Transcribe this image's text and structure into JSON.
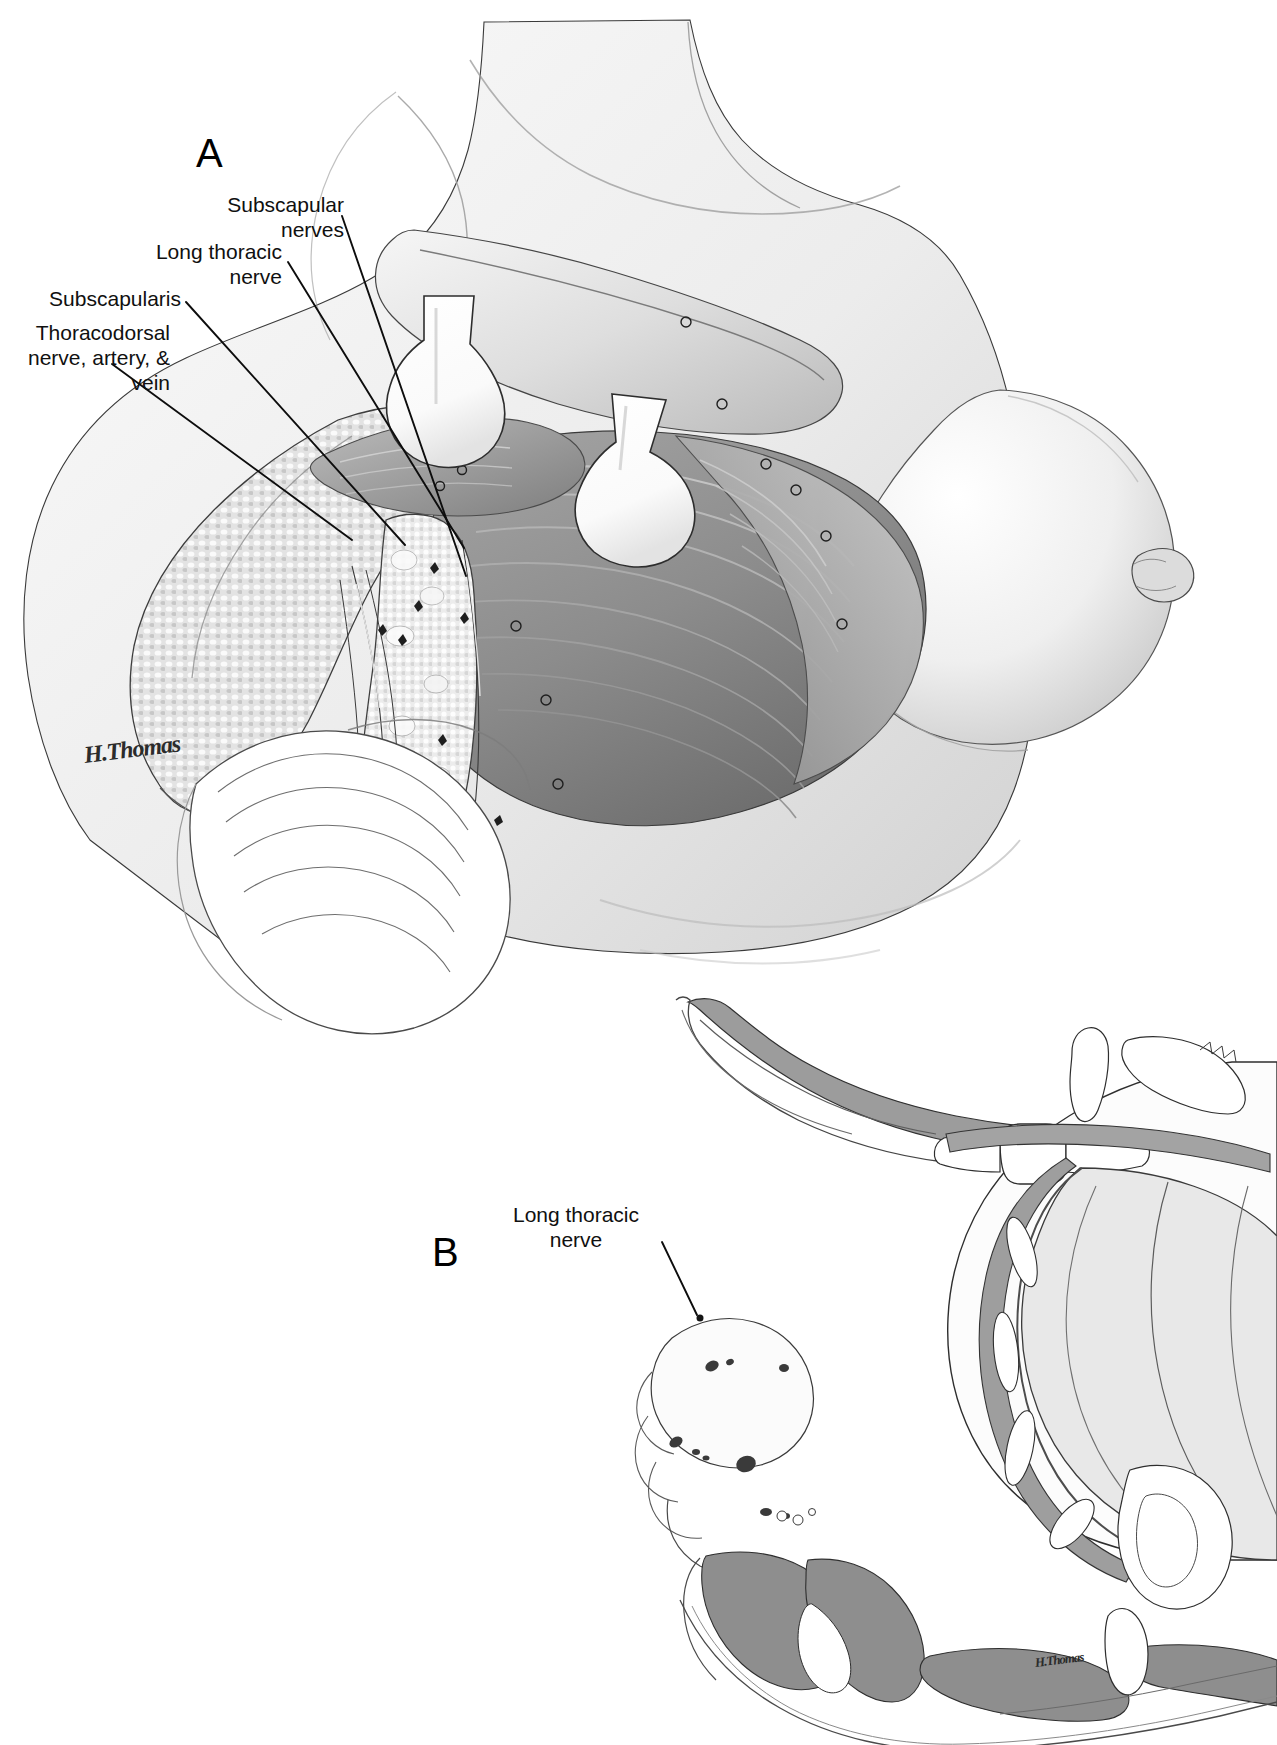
{
  "figure": {
    "background_color": "#ffffff",
    "ink_color": "#101010"
  },
  "panels": [
    {
      "id": "A",
      "letter": "A",
      "letter_pos": {
        "x": 196,
        "y": 133
      },
      "caption": "Surgical exposure of the axilla with retractors in place",
      "signature": {
        "text": "H.Thomas",
        "x": 84,
        "y": 742,
        "size": 24
      }
    },
    {
      "id": "B",
      "letter": "B",
      "letter_pos": {
        "x": 432,
        "y": 1232
      },
      "caption": "Transverse cross section of the thorax at the level of the axilla",
      "signature": {
        "text": "H.Thomas",
        "x": 1035,
        "y": 1655,
        "size": 13
      }
    }
  ],
  "labels": [
    {
      "id": "subscapular-nerves",
      "panel": "A",
      "text": "Subscapular\nnerves",
      "align": "right",
      "x": 104,
      "y": 192,
      "width": 240,
      "leader": {
        "x1": 342,
        "y1": 216,
        "x2": 466,
        "y2": 576
      }
    },
    {
      "id": "long-thoracic-nerve",
      "panel": "A",
      "text": "Long thoracic\nnerve",
      "align": "right",
      "x": 24,
      "y": 239,
      "width": 258,
      "leader": {
        "x1": 288,
        "y1": 262,
        "x2": 464,
        "y2": 548
      }
    },
    {
      "id": "subscapularis",
      "panel": "A",
      "text": "Subscapularis",
      "align": "right",
      "x": 18,
      "y": 286,
      "width": 163,
      "leader": {
        "x1": 186,
        "y1": 302,
        "x2": 405,
        "y2": 545
      }
    },
    {
      "id": "thoracodorsal-bundle",
      "panel": "A",
      "text": "Thoracodorsal\nnerve, artery, &\nvein",
      "align": "right",
      "x": 8,
      "y": 320,
      "width": 162,
      "leader": {
        "x1": 112,
        "y1": 364,
        "x2": 352,
        "y2": 540
      }
    },
    {
      "id": "long-thoracic-nerve-xsection",
      "panel": "B",
      "text": "Long thoracic\nnerve",
      "align": "center",
      "x": 500,
      "y": 1202,
      "width": 152,
      "leader": {
        "x1": 662,
        "y1": 1242,
        "x2": 697,
        "y2": 1315
      }
    }
  ],
  "palette": {
    "line": "#101010",
    "muscle_dark": "#8d8d8d",
    "muscle_mid": "#a9a9a9",
    "muscle_light": "#c6c6c6",
    "skin_light": "#e9e9e9",
    "skin_mid": "#d3d3d3",
    "fat_light": "#f2f2f2",
    "retractor": "#ffffff",
    "lung": "#e4e4e4",
    "section_gray": "#9a9a9a",
    "bone_white": "#ffffff"
  },
  "structures_panel_a": [
    {
      "name": "breast",
      "description": "Right breast with nipple, upper right"
    },
    {
      "name": "pectoralis-major-flap",
      "description": "Retracted pectoral muscle flap"
    },
    {
      "name": "serratus-anterior",
      "description": "Chest wall muscle striations"
    },
    {
      "name": "latissimus-dorsi",
      "description": "Lateral muscular border"
    },
    {
      "name": "axillary-fat-nodes",
      "description": "Nodular axillary fat pad"
    },
    {
      "name": "retractor-upper",
      "description": "Army-navy style retractor blade"
    },
    {
      "name": "retractor-lower",
      "description": "Second retractor blade"
    },
    {
      "name": "surgical-drape",
      "description": "Draped arm, lower left"
    }
  ],
  "structures_panel_b": [
    {
      "name": "scapula-section",
      "description": "Shaded scapula and overlying muscle"
    },
    {
      "name": "vertebral-body",
      "description": "Central vertebra"
    },
    {
      "name": "lung-field",
      "description": "Large ovoid lung section"
    },
    {
      "name": "ribs",
      "description": "Sectioned ribs along chest wall"
    },
    {
      "name": "breast-tissue-section",
      "description": "Breast with lymph nodes, left"
    },
    {
      "name": "intercostal-muscles",
      "description": "Shaded intercostal layers"
    },
    {
      "name": "paraspinal-muscles",
      "description": "Posterior shaded muscle mass"
    }
  ]
}
